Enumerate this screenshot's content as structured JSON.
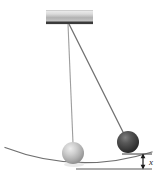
{
  "figure": {
    "background_color": "#ffffff",
    "width": 161,
    "height": 179
  },
  "support": {
    "name": "ceiling-block",
    "face_color_light": "#e8e8e8",
    "face_color_mid": "#b9b9b9",
    "edge_color": "#3a3a3a",
    "x": 46,
    "y": 10,
    "width": 47,
    "height": 14
  },
  "pivot": {
    "name": "pivot-point",
    "x": 68,
    "y": 24
  },
  "strings": [
    {
      "name": "string-rest-position",
      "color": "#9a9a9a",
      "x1": 68,
      "y1": 24,
      "x2": 73,
      "y2": 143
    },
    {
      "name": "string-displaced-position",
      "color": "#6e6e6e",
      "x1": 69,
      "y1": 24,
      "x2": 124,
      "y2": 135
    }
  ],
  "bobs": [
    {
      "name": "bob-light-rest",
      "label": "light sphere at rest",
      "cx": 73,
      "cy": 153,
      "r": 11,
      "color_highlight": "#e2e2e2",
      "color_mid": "#b4b4b4",
      "color_shadow": "#8f8f8f"
    },
    {
      "name": "bob-dark-displaced",
      "label": "dark sphere displaced",
      "cx": 128,
      "cy": 142,
      "r": 11,
      "color_highlight": "#7a7a7a",
      "color_mid": "#4d4d4d",
      "color_shadow": "#2b2b2b"
    }
  ],
  "surface": {
    "name": "curved-surface",
    "color": "#6f6f6f",
    "left_x": 5,
    "left_y": 148,
    "bottom_x": 80,
    "bottom_y": 166,
    "right_x": 152,
    "right_y": 152
  },
  "baseline": {
    "name": "reference-baseline",
    "color": "#5a5a5a",
    "x1": 76,
    "y1": 169,
    "x2": 152,
    "y2": 169
  },
  "tick_line": {
    "name": "upper-tick-line",
    "color": "#5a5a5a",
    "x1": 122,
    "y1": 154,
    "x2": 152,
    "y2": 154
  },
  "dimension": {
    "name": "height-dimension",
    "label": "x",
    "arrow_x": 143,
    "top_y": 154,
    "bottom_y": 169,
    "label_x": 149,
    "label_y": 164,
    "color": "#1a1a1a"
  }
}
